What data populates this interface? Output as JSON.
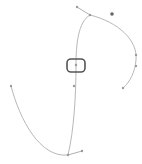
{
  "canvas": {
    "width": 142,
    "height": 164,
    "background": "#ffffff",
    "stroke_color": "#b8b8b8",
    "handle_color": "#9a9a9a",
    "selection_color": "#555555",
    "marker_color": "#666666"
  },
  "paths": [
    {
      "name": "upper-arc",
      "d": "M 90 15 C 118 22, 138 40, 136 60 C 135 72, 130 82, 123 88"
    },
    {
      "name": "main-stem",
      "d": "M 90 15 C 78 22, 76 45, 76 65 C 76 95, 74 130, 68 155"
    },
    {
      "name": "lower-left-arc",
      "d": "M 11 86 C 20 120, 40 158, 68 155"
    }
  ],
  "handles": [
    {
      "name": "top-handle-line",
      "x1": 77,
      "y1": 7,
      "x2": 90,
      "y2": 15
    },
    {
      "name": "bottom-handle-line",
      "x1": 68,
      "y1": 155,
      "x2": 82,
      "y2": 151
    }
  ],
  "points": [
    {
      "name": "top-handle-point",
      "x": 77,
      "y": 7
    },
    {
      "name": "top-anchor-point",
      "x": 90,
      "y": 15
    },
    {
      "name": "right-anchor-point",
      "x": 136,
      "y": 55
    },
    {
      "name": "right-handle-point",
      "x": 136,
      "y": 66
    },
    {
      "name": "right-end-point",
      "x": 123,
      "y": 88
    },
    {
      "name": "center-point",
      "x": 76,
      "y": 65
    },
    {
      "name": "mid-point",
      "x": 74,
      "y": 86
    },
    {
      "name": "left-start-point",
      "x": 11,
      "y": 86
    },
    {
      "name": "bottom-anchor-point",
      "x": 68,
      "y": 155
    },
    {
      "name": "bottom-handle-point",
      "x": 82,
      "y": 151
    }
  ],
  "marker": {
    "name": "dark-marker",
    "x": 112,
    "y": 14
  },
  "selection": {
    "x": 67,
    "y": 59,
    "width": 18,
    "height": 13,
    "rx": 4
  }
}
